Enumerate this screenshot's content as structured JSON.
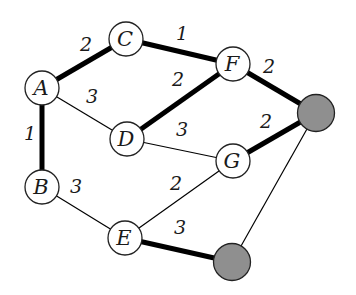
{
  "graph": {
    "colors": {
      "node_fill": "#ffffff",
      "node_stroke": "#222222",
      "special_fill": "#8f8f8f",
      "edge": "#000000",
      "text": "#1a1a1a"
    },
    "nodes": [
      {
        "id": "A",
        "label": "A",
        "special": false
      },
      {
        "id": "B",
        "label": "B",
        "special": false
      },
      {
        "id": "C",
        "label": "C",
        "special": false
      },
      {
        "id": "D",
        "label": "D",
        "special": false
      },
      {
        "id": "E",
        "label": "E",
        "special": false
      },
      {
        "id": "F",
        "label": "F",
        "special": false
      },
      {
        "id": "G",
        "label": "G",
        "special": false
      },
      {
        "id": "S1",
        "label": "",
        "special": true
      },
      {
        "id": "S2",
        "label": "",
        "special": true
      }
    ],
    "edges": [
      {
        "from": "A",
        "to": "C",
        "weight": "2",
        "highlighted": true
      },
      {
        "from": "C",
        "to": "F",
        "weight": "1",
        "highlighted": true
      },
      {
        "from": "A",
        "to": "D",
        "weight": "3",
        "highlighted": false
      },
      {
        "from": "D",
        "to": "F",
        "weight": "2",
        "highlighted": true
      },
      {
        "from": "F",
        "to": "S1",
        "weight": "2",
        "highlighted": true
      },
      {
        "from": "A",
        "to": "B",
        "weight": "1",
        "highlighted": true
      },
      {
        "from": "D",
        "to": "G",
        "weight": "3",
        "highlighted": false
      },
      {
        "from": "G",
        "to": "S1",
        "weight": "2",
        "highlighted": true
      },
      {
        "from": "B",
        "to": "E",
        "weight": "3",
        "highlighted": false
      },
      {
        "from": "E",
        "to": "G",
        "weight": "2",
        "highlighted": false
      },
      {
        "from": "E",
        "to": "S2",
        "weight": "3",
        "highlighted": true
      },
      {
        "from": "S2",
        "to": "S1",
        "weight": "",
        "highlighted": false
      }
    ]
  }
}
